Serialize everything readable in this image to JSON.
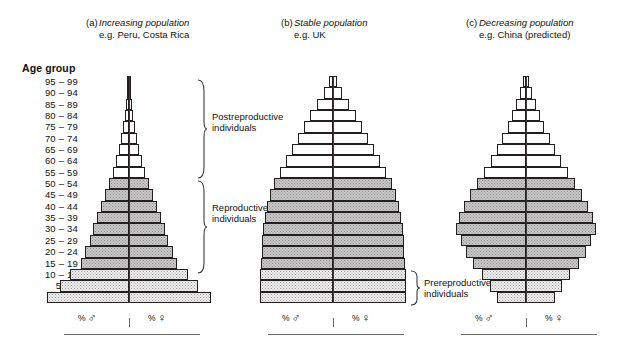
{
  "figure": {
    "age_axis_title": "Age group",
    "age_groups": [
      "95 – 99",
      "90 – 94",
      "85 – 89",
      "80 – 84",
      "75 – 79",
      "70 – 74",
      "65 – 69",
      "60 – 64",
      "55 – 59",
      "50 – 54",
      "45 – 49",
      "40 – 44",
      "35 – 39",
      "30 – 34",
      "25 – 29",
      "20 – 24",
      "15 – 19",
      "10 – 14",
      "5 – 9",
      "0 – 4"
    ],
    "axis_legend": {
      "male_pct": "%",
      "male_symbol": "♂",
      "female_pct": "%",
      "female_symbol": "♀"
    },
    "annotations": [
      {
        "name": "postreproductive",
        "line1": "Postreproductive",
        "line2": "individuals"
      },
      {
        "name": "reproductive",
        "line1": "Reproductive",
        "line2": "individuals"
      },
      {
        "name": "prereproductive",
        "line1": "Prereproductive",
        "line2": "individuals"
      }
    ],
    "class_colors": {
      "postreproductive": "#ffffff",
      "reproductive": "#c9c9c9",
      "prereproductive": "#f2f2f2",
      "outline": "#231f20"
    }
  },
  "chart_data": {
    "type": "bar",
    "xlabel": "% ♂   |   % ♀",
    "ylabel": "Age group",
    "categories": [
      "95 – 99",
      "90 – 94",
      "85 – 89",
      "80 – 84",
      "75 – 79",
      "70 – 74",
      "65 – 69",
      "60 – 64",
      "55 – 59",
      "50 – 54",
      "45 – 49",
      "40 – 44",
      "35 – 39",
      "30 – 34",
      "25 – 29",
      "20 – 24",
      "15 – 19",
      "10 – 14",
      "5 – 9",
      "0 – 4"
    ],
    "class_of_category": [
      "post",
      "post",
      "post",
      "post",
      "post",
      "post",
      "post",
      "post",
      "post",
      "repro",
      "repro",
      "repro",
      "repro",
      "repro",
      "repro",
      "repro",
      "repro",
      "pre",
      "pre",
      "pre"
    ],
    "grid": false,
    "legend": "none",
    "panels": [
      {
        "key": "a",
        "label": "(a)",
        "title": "Increasing population",
        "subtitle": "e.g. Peru, Costa Rica",
        "series": [
          {
            "name": "male",
            "values": [
              1.2,
              2.0,
              3.0,
              4.4,
              6.0,
              8.0,
              10.5,
              13.5,
              17.0,
              21.5,
              25.5,
              29.5,
              33.5,
              37.5,
              41.5,
              46.0,
              51.0,
              62.0,
              73.0,
              86.0
            ]
          },
          {
            "name": "female",
            "values": [
              1.2,
              2.0,
              3.0,
              4.4,
              6.0,
              8.0,
              10.5,
              13.5,
              17.0,
              21.5,
              25.5,
              29.5,
              33.5,
              37.5,
              41.5,
              46.0,
              51.0,
              62.0,
              73.0,
              86.0
            ]
          }
        ]
      },
      {
        "key": "b",
        "label": "(b)",
        "title": "Stable population",
        "subtitle": "e.g. UK",
        "series": [
          {
            "name": "male",
            "values": [
              4.5,
              10.5,
              19.0,
              27.0,
              34.0,
              41.0,
              48.0,
              55.0,
              62.0,
              69.0,
              74.0,
              78.0,
              80.0,
              82.0,
              83.0,
              84.0,
              85.0,
              85.5,
              86.0,
              86.0
            ]
          },
          {
            "name": "female",
            "values": [
              4.5,
              10.5,
              19.0,
              27.0,
              34.0,
              41.0,
              48.0,
              55.0,
              62.0,
              69.0,
              74.0,
              78.0,
              80.0,
              82.0,
              83.0,
              84.0,
              85.0,
              85.5,
              86.0,
              86.0
            ]
          }
        ]
      },
      {
        "key": "c",
        "label": "(c)",
        "title": "Decreasing population",
        "subtitle": "e.g. China (predicted)",
        "series": [
          {
            "name": "male",
            "values": [
              3.5,
              7.0,
              11.0,
              16.0,
              21.0,
              27.0,
              33.0,
              40.0,
              48.0,
              56.0,
              64.0,
              71.0,
              76.0,
              79.0,
              74.0,
              68.0,
              60.0,
              50.0,
              41.0,
              33.0
            ]
          },
          {
            "name": "female",
            "values": [
              3.5,
              7.0,
              11.0,
              16.0,
              21.0,
              27.0,
              33.0,
              40.0,
              48.0,
              56.0,
              64.0,
              71.0,
              76.0,
              79.0,
              74.0,
              68.0,
              60.0,
              50.0,
              41.0,
              33.0
            ]
          }
        ]
      }
    ]
  }
}
